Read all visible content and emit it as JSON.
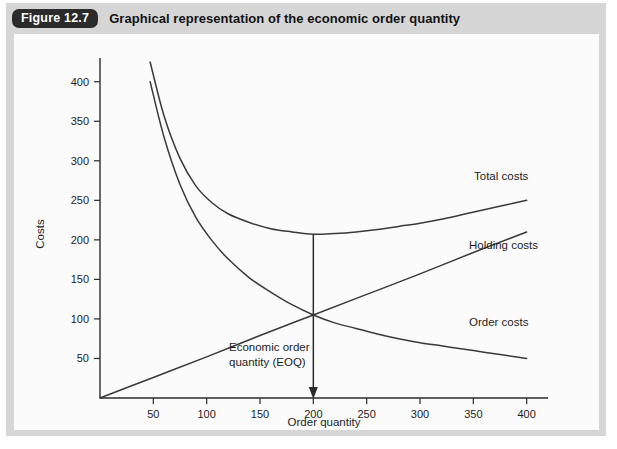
{
  "figure": {
    "badge": "Figure 12.7",
    "title": "Graphical representation of the economic order quantity"
  },
  "chart_data": {
    "type": "line",
    "title": "Graphical representation of the economic order quantity",
    "xlabel": "Order quantity",
    "ylabel": "Costs",
    "xlim": [
      0,
      420
    ],
    "ylim": [
      0,
      430
    ],
    "xticks": [
      50,
      100,
      150,
      200,
      250,
      300,
      350,
      400
    ],
    "yticks": [
      50,
      100,
      150,
      200,
      250,
      300,
      350,
      400
    ],
    "grid": false,
    "legend_position": "inline-right",
    "series": [
      {
        "name": "Total costs",
        "label": "Total costs",
        "color": "#3a3a3a",
        "x": [
          47,
          60,
          75,
          90,
          105,
          120,
          140,
          160,
          180,
          200,
          220,
          240,
          260,
          280,
          300,
          320,
          340,
          360,
          380,
          400
        ],
        "y": [
          425,
          357,
          303,
          268,
          247,
          233,
          222,
          214,
          210,
          207,
          208,
          210,
          213,
          217,
          221,
          226,
          232,
          238,
          244,
          250
        ]
      },
      {
        "name": "Holding costs",
        "label": "Holding costs",
        "color": "#3a3a3a",
        "x": [
          0,
          50,
          100,
          150,
          200,
          250,
          300,
          350,
          400
        ],
        "y": [
          0,
          26,
          52,
          79,
          105,
          131,
          157,
          184,
          210
        ]
      },
      {
        "name": "Order costs",
        "label": "Order costs",
        "color": "#3a3a3a",
        "x": [
          47,
          60,
          75,
          90,
          105,
          120,
          140,
          160,
          180,
          200,
          220,
          240,
          260,
          280,
          300,
          320,
          340,
          360,
          380,
          400
        ],
        "y": [
          400,
          330,
          270,
          228,
          199,
          176,
          152,
          134,
          118,
          105,
          95,
          88,
          81,
          75,
          70,
          66,
          62,
          58,
          54,
          50
        ]
      }
    ],
    "annotations": [
      {
        "name": "eoq-annotation",
        "text_line1": "Economic order",
        "text_line2": "quantity (EOQ)",
        "arrow_x": 200,
        "arrow_y_from": 207,
        "arrow_y_to": 0
      }
    ]
  },
  "axes": {
    "y_title": "Costs",
    "x_title": "Order quantity",
    "y_tick_labels": [
      "50",
      "100",
      "150",
      "200",
      "250",
      "300",
      "350",
      "400"
    ],
    "x_tick_labels": [
      "50",
      "100",
      "150",
      "200",
      "250",
      "300",
      "350",
      "400"
    ]
  },
  "labels": {
    "total_costs": "Total costs",
    "holding_costs": "Holding costs",
    "order_costs": "Order costs",
    "eoq_line1": "Economic order",
    "eoq_line2": "quantity (EOQ)"
  },
  "colors": {
    "card_background": "#d6d6d6",
    "panel_background": "#fbfbfb",
    "badge_background": "#2b2b2b",
    "badge_text": "#ffffff",
    "title_text": "#121212",
    "curve": "#3a3a3a",
    "axis": "#2b2b2b"
  }
}
